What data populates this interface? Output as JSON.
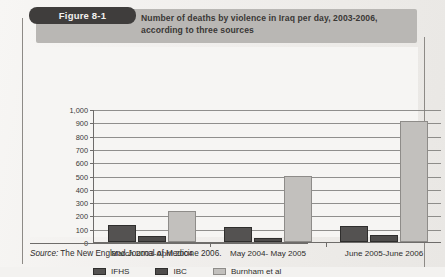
{
  "figure": {
    "badge_label": "Figure 8-1",
    "title": "Number of deaths by violence in Iraq per day, 2003-2006, according to three sources",
    "source_prefix": "Source:",
    "source_text": "The New England Journal of Medicine 2006."
  },
  "chart_data": {
    "type": "bar",
    "title": "Number of deaths by violence in Iraq per day, 2003-2006, according to three sources",
    "xlabel": "",
    "ylabel": "",
    "ylim": [
      0,
      1000
    ],
    "ytick_step": 100,
    "ytick_labels": [
      "1,000",
      "900",
      "800",
      "700",
      "600",
      "500",
      "400",
      "300",
      "200",
      "100",
      "0"
    ],
    "grid": true,
    "legend_position": "bottom",
    "categories": [
      "March 2003-April 2004",
      "May 2004- May 2005",
      "June 2005-June 2006"
    ],
    "series": [
      {
        "name": "IFHS",
        "color": "#545251",
        "values": [
          125,
          110,
          120
        ]
      },
      {
        "name": "IBC",
        "color": "#4e4c4b",
        "values": [
          45,
          30,
          55
        ]
      },
      {
        "name": "Burnham et al",
        "color": "#c2c0bd",
        "values": [
          230,
          495,
          910
        ]
      }
    ]
  }
}
